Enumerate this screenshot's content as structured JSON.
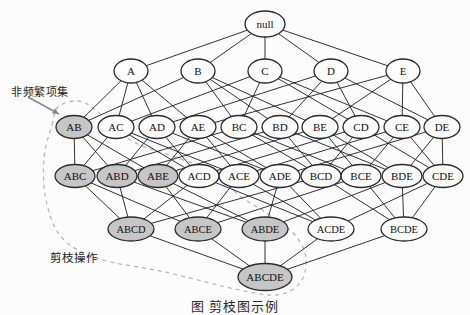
{
  "figure": {
    "caption": "图  剪枝图示例",
    "annotations": {
      "infrequent": {
        "text": "非频繁项集"
      },
      "prune": {
        "text": "剪枝操作"
      }
    },
    "colors": {
      "background": "#fcfcfc",
      "node_fill": "#fdfdfd",
      "shaded_fill": "#c6c6c6",
      "node_stroke": "#2b2b2b",
      "edge": "#1c1c1c",
      "dashed_boundary": "#b8b8b8",
      "arrow": "#8a8a8a",
      "text": "#111111"
    },
    "nodes": [
      {
        "label": "null",
        "x": 265,
        "y": 24,
        "shaded": false
      },
      {
        "label": "A",
        "x": 131,
        "y": 71,
        "shaded": false
      },
      {
        "label": "B",
        "x": 198,
        "y": 71,
        "shaded": false
      },
      {
        "label": "C",
        "x": 265,
        "y": 71,
        "shaded": false
      },
      {
        "label": "D",
        "x": 331,
        "y": 71,
        "shaded": false
      },
      {
        "label": "E",
        "x": 403,
        "y": 71,
        "shaded": false
      },
      {
        "label": "AB",
        "x": 74,
        "y": 127,
        "shaded": true
      },
      {
        "label": "AC",
        "x": 116,
        "y": 127,
        "shaded": false
      },
      {
        "label": "AD",
        "x": 157,
        "y": 127,
        "shaded": false
      },
      {
        "label": "AE",
        "x": 198,
        "y": 127,
        "shaded": false
      },
      {
        "label": "BC",
        "x": 239,
        "y": 127,
        "shaded": false
      },
      {
        "label": "BD",
        "x": 280,
        "y": 127,
        "shaded": false
      },
      {
        "label": "BE",
        "x": 320,
        "y": 127,
        "shaded": false
      },
      {
        "label": "CD",
        "x": 361,
        "y": 127,
        "shaded": false
      },
      {
        "label": "CE",
        "x": 402,
        "y": 127,
        "shaded": false
      },
      {
        "label": "DE",
        "x": 442,
        "y": 127,
        "shaded": false
      },
      {
        "label": "ABC",
        "x": 75,
        "y": 176,
        "shaded": true
      },
      {
        "label": "ABD",
        "x": 117,
        "y": 176,
        "shaded": true
      },
      {
        "label": "ABE",
        "x": 158,
        "y": 176,
        "shaded": true
      },
      {
        "label": "ACD",
        "x": 199,
        "y": 176,
        "shaded": false
      },
      {
        "label": "ACE",
        "x": 239,
        "y": 176,
        "shaded": false
      },
      {
        "label": "ADE",
        "x": 280,
        "y": 176,
        "shaded": false
      },
      {
        "label": "BCD",
        "x": 321,
        "y": 176,
        "shaded": false
      },
      {
        "label": "BCE",
        "x": 361,
        "y": 176,
        "shaded": false
      },
      {
        "label": "BDE",
        "x": 402,
        "y": 176,
        "shaded": false
      },
      {
        "label": "CDE",
        "x": 443,
        "y": 176,
        "shaded": false
      },
      {
        "label": "ABCD",
        "x": 131,
        "y": 229,
        "shaded": true
      },
      {
        "label": "ABCE",
        "x": 198,
        "y": 229,
        "shaded": true
      },
      {
        "label": "ABDE",
        "x": 265,
        "y": 229,
        "shaded": true
      },
      {
        "label": "ACDE",
        "x": 331,
        "y": 229,
        "shaded": false
      },
      {
        "label": "BCDE",
        "x": 404,
        "y": 229,
        "shaded": false
      },
      {
        "label": "ABCDE",
        "x": 265,
        "y": 277,
        "shaded": true
      }
    ],
    "arrow": {
      "x1": 28,
      "y1": 97,
      "x2": 59,
      "y2": 114
    },
    "pruning_boundary": [
      [
        52,
        125
      ],
      [
        58,
        107
      ],
      [
        78,
        101
      ],
      [
        97,
        111
      ],
      [
        132,
        141
      ],
      [
        178,
        158
      ],
      [
        214,
        172
      ],
      [
        240,
        196
      ],
      [
        270,
        215
      ],
      [
        295,
        235
      ],
      [
        306,
        258
      ],
      [
        300,
        283
      ],
      [
        276,
        295
      ],
      [
        235,
        289
      ],
      [
        165,
        272
      ],
      [
        100,
        259
      ],
      [
        62,
        238
      ],
      [
        46,
        200
      ],
      [
        44,
        158
      ]
    ]
  }
}
